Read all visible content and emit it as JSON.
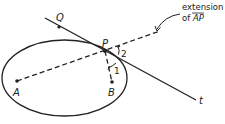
{
  "diagram": {
    "type": "ellipse-reflection-property",
    "ellipse": {
      "cx": 64.5,
      "cy": 78,
      "rx": 62.5,
      "ry": 38
    },
    "points": {
      "A": {
        "label": "A",
        "x": 17,
        "y": 81
      },
      "B": {
        "label": "B",
        "x": 112,
        "y": 82
      },
      "P": {
        "label": "P",
        "x": 105,
        "y": 51
      },
      "Q": {
        "label": "Q",
        "x": 59,
        "y": 27
      }
    },
    "tangent_line": {
      "label": "t",
      "x1": 45,
      "y1": 18,
      "x2": 196,
      "y2": 100
    },
    "extension_line": {
      "x1": 17,
      "y1": 81,
      "x2": 160,
      "y2": 31
    },
    "segment_PB": {
      "x1": 105,
      "y1": 51,
      "x2": 112,
      "y2": 82
    },
    "angles": [
      {
        "label": "1",
        "description": "angle between PB and tangent t"
      },
      {
        "label": "2",
        "description": "angle between tangent t and extension of AP"
      }
    ],
    "annotation": {
      "line1": "extension",
      "line2_prefix": "of ",
      "line2_segment": "AP"
    },
    "colors": {
      "stroke": "#222222",
      "background": "#ffffff"
    }
  }
}
